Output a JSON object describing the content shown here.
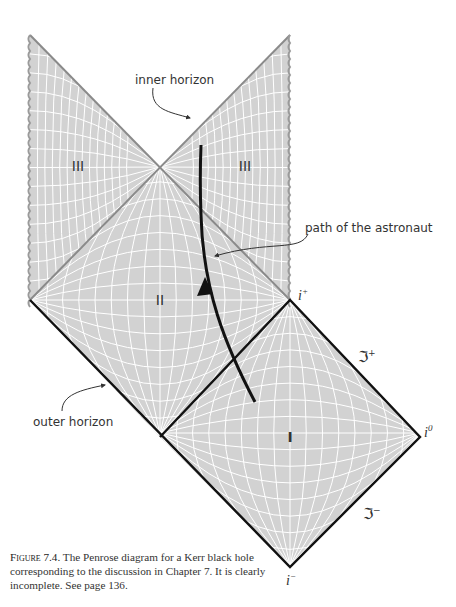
{
  "figure": {
    "type": "penrose-diagram",
    "subject": "Kerr black hole",
    "regions": [
      {
        "id": "I",
        "label": "I"
      },
      {
        "id": "II",
        "label": "II"
      },
      {
        "id": "III-left",
        "label": "III"
      },
      {
        "id": "III-right",
        "label": "III"
      }
    ],
    "annotations": {
      "inner_horizon": "inner horizon",
      "outer_horizon": "outer horizon",
      "astronaut_path": "path of the astronaut"
    },
    "infinity_labels": {
      "i_plus": "i",
      "i_plus_sup": "+",
      "i_zero": "i",
      "i_zero_sup": "0",
      "i_minus": "i",
      "i_minus_sup": "−",
      "scri_plus": "ℑ",
      "scri_plus_sup": "+",
      "scri_minus": "ℑ",
      "scri_minus_sup": "−"
    },
    "colors": {
      "region_fill": "#d2d2d2",
      "grid_line": "#ffffff",
      "boundary_black": "#111111",
      "boundary_gray": "#8a8a8a",
      "roman_label": "#7a7a7a"
    }
  },
  "caption": {
    "figure_number": "Figure 7.4.",
    "text": "The Penrose diagram for a Kerr black hole corresponding to the discussion in Chapter 7. It is clearly incomplete. See page 136."
  }
}
